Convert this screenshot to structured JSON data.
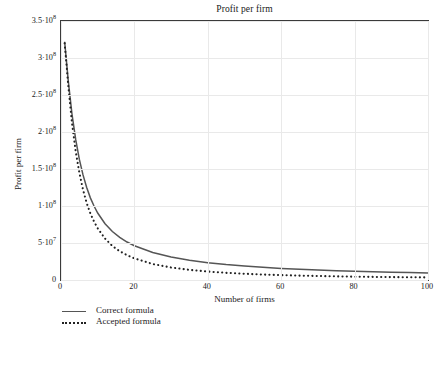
{
  "figure": {
    "background": "#ffffff",
    "axis_color": "#3a3a3a",
    "grid_color": "#e9e9e9"
  },
  "legend": {
    "items": [
      {
        "label": "Correct formula",
        "style": "solid",
        "color": "#555555"
      },
      {
        "label": "Accepted formula",
        "style": "dotted",
        "color": "#222222"
      }
    ]
  },
  "chart_data": [
    {
      "type": "line",
      "title": "Profit per firm",
      "xlabel": "Number of firms",
      "ylabel": "Profit per firm",
      "xlim": [
        0,
        100
      ],
      "ylim": [
        0,
        350000000
      ],
      "grid": true,
      "legend_position": "below-left",
      "xticks": [
        0,
        20,
        40,
        60,
        80,
        100
      ],
      "xticklabels": [
        "0",
        "20",
        "40",
        "60",
        "80",
        "100"
      ],
      "yticks": [
        0,
        50000000,
        100000000,
        150000000,
        200000000,
        250000000,
        300000000,
        350000000
      ],
      "yticklabels": [
        "0",
        "5·10⁷",
        "1·10⁸",
        "1.5·10⁸",
        "2·10⁸",
        "2.5·10⁸",
        "3·10⁸",
        "3.5·10⁸"
      ],
      "x": [
        1,
        2,
        3,
        4,
        5,
        6,
        7,
        8,
        9,
        10,
        12,
        14,
        16,
        18,
        20,
        25,
        30,
        35,
        40,
        45,
        50,
        55,
        60,
        65,
        70,
        75,
        80,
        85,
        90,
        95,
        100
      ],
      "series": [
        {
          "name": "Correct formula",
          "style": "solid",
          "color": "#555555",
          "values": [
            322000000,
            268000000,
            224000000,
            190000000,
            163000000,
            142000000,
            125000000,
            111000000,
            100000000,
            90500000,
            76000000,
            65500000,
            57500000,
            51300000,
            46300000,
            37200000,
            31100000,
            26700000,
            23400000,
            20800000,
            18800000,
            17100000,
            15700000,
            14500000,
            13500000,
            12600000,
            11800000,
            11200000,
            10600000,
            10000000,
            9600000
          ]
        },
        {
          "name": "Accepted formula",
          "style": "dotted",
          "color": "#222222",
          "values": [
            320000000,
            262000000,
            212000000,
            174000000,
            145000000,
            122000000,
            104000000,
            90000000,
            79000000,
            70000000,
            56000000,
            46000000,
            39000000,
            33500000,
            29200000,
            21600000,
            16900000,
            13700000,
            11400000,
            9700000,
            8400000,
            7400000,
            6600000,
            5900000,
            5400000,
            4900000,
            4500000,
            4200000,
            3900000,
            3700000,
            3500000
          ]
        }
      ]
    },
    {
      "type": "line",
      "title": "Profit gap per firm",
      "xlim": [
        0,
        100
      ],
      "ylim": [
        0,
        25000000
      ],
      "grid": true,
      "clipped": true,
      "yticks": [
        25000000
      ],
      "yticklabels": [
        "2.5·10⁷"
      ],
      "x": [
        0,
        4,
        8,
        10,
        12,
        14,
        16,
        18,
        20,
        24,
        30,
        40,
        60,
        80,
        100
      ],
      "series": [
        {
          "name": "Profit gap",
          "style": "solid",
          "color": "#555555",
          "values": [
            0,
            11000000,
            19500000,
            22000000,
            23600000,
            24300000,
            24400000,
            24000000,
            23300000,
            21400000,
            18600000,
            14500000,
            10000000,
            7600000,
            6100000
          ]
        }
      ]
    }
  ]
}
